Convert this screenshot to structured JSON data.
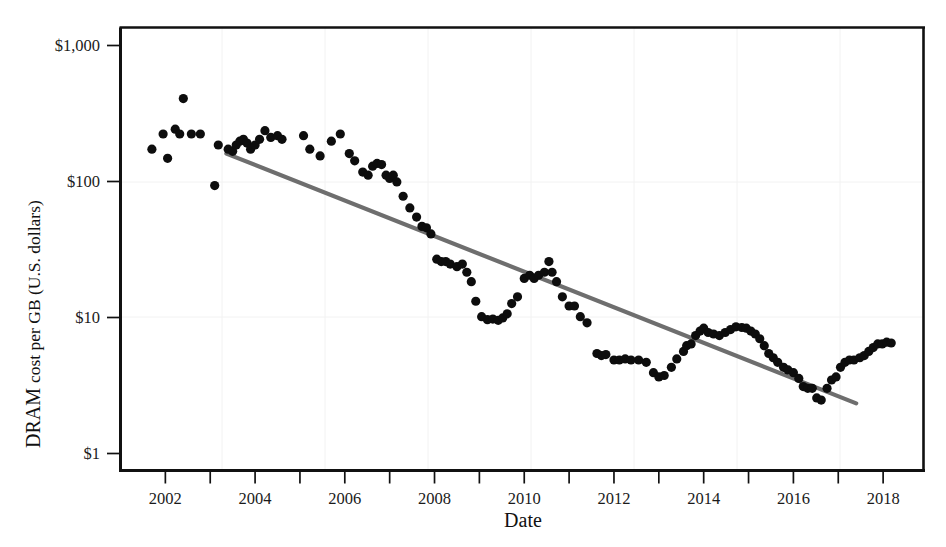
{
  "chart_data": {
    "type": "scatter",
    "title": "",
    "xlabel": "Date",
    "ylabel": "DRAM cost per GB (U.S. dollars)",
    "ylabel_parts": {
      "lead": "DRAM",
      "rest": "cost per GB (U.S. dollars)"
    },
    "yscale": "log",
    "ylim": [
      1,
      1000
    ],
    "xlim": [
      2001.0,
      2018.9
    ],
    "grid": false,
    "legend": null,
    "x_tick_labels": [
      "2002",
      "2004",
      "2006",
      "2008",
      "2010",
      "2012",
      "2014",
      "2016",
      "2018"
    ],
    "x_tick_values": [
      2002,
      2004,
      2006,
      2008,
      2010,
      2012,
      2014,
      2016,
      2018
    ],
    "x_minor_tick_values": [
      2003,
      2005,
      2007,
      2009,
      2011,
      2013,
      2015,
      2017
    ],
    "y_tick_labels": [
      "$1,000",
      "$100",
      "$10",
      "$1"
    ],
    "y_tick_values": [
      1000,
      100,
      10,
      1
    ],
    "colors": {
      "points": "#0d0d0d",
      "trendline": "#6e6e6e",
      "axis": "#111111",
      "background": "#ffffff"
    },
    "point_radius_px": 4.6,
    "series": [
      {
        "name": "DRAM cost per GB",
        "marker": "filled-circle",
        "points": [
          [
            2001.7,
            150
          ],
          [
            2001.95,
            190
          ],
          [
            2002.05,
            130
          ],
          [
            2002.22,
            205
          ],
          [
            2002.32,
            190
          ],
          [
            2002.4,
            330
          ],
          [
            2002.58,
            190
          ],
          [
            2002.78,
            190
          ],
          [
            2003.1,
            85
          ],
          [
            2003.18,
            160
          ],
          [
            2003.4,
            150
          ],
          [
            2003.5,
            145
          ],
          [
            2003.58,
            160
          ],
          [
            2003.66,
            170
          ],
          [
            2003.74,
            175
          ],
          [
            2003.82,
            165
          ],
          [
            2003.9,
            150
          ],
          [
            2004.0,
            160
          ],
          [
            2004.1,
            175
          ],
          [
            2004.22,
            200
          ],
          [
            2004.35,
            180
          ],
          [
            2004.5,
            185
          ],
          [
            2004.6,
            175
          ],
          [
            2005.08,
            185
          ],
          [
            2005.22,
            150
          ],
          [
            2005.45,
            135
          ],
          [
            2005.7,
            170
          ],
          [
            2005.9,
            190
          ],
          [
            2006.1,
            140
          ],
          [
            2006.22,
            125
          ],
          [
            2006.4,
            105
          ],
          [
            2006.52,
            100
          ],
          [
            2006.62,
            115
          ],
          [
            2006.72,
            120
          ],
          [
            2006.82,
            118
          ],
          [
            2006.92,
            100
          ],
          [
            2007.0,
            95
          ],
          [
            2007.08,
            100
          ],
          [
            2007.16,
            90
          ],
          [
            2007.3,
            72
          ],
          [
            2007.45,
            60
          ],
          [
            2007.6,
            52
          ],
          [
            2007.72,
            45
          ],
          [
            2007.82,
            44
          ],
          [
            2007.92,
            40
          ],
          [
            2008.05,
            27
          ],
          [
            2008.15,
            26
          ],
          [
            2008.25,
            26
          ],
          [
            2008.35,
            25
          ],
          [
            2008.5,
            24
          ],
          [
            2008.62,
            25
          ],
          [
            2008.72,
            22
          ],
          [
            2008.82,
            19
          ],
          [
            2008.92,
            14
          ],
          [
            2009.05,
            11
          ],
          [
            2009.18,
            10.5
          ],
          [
            2009.3,
            10.6
          ],
          [
            2009.42,
            10.4
          ],
          [
            2009.52,
            10.8
          ],
          [
            2009.62,
            11.5
          ],
          [
            2009.72,
            13.5
          ],
          [
            2009.85,
            15
          ],
          [
            2010.0,
            20
          ],
          [
            2010.12,
            21
          ],
          [
            2010.22,
            20
          ],
          [
            2010.32,
            21
          ],
          [
            2010.45,
            22
          ],
          [
            2010.55,
            26
          ],
          [
            2010.62,
            22
          ],
          [
            2010.72,
            19
          ],
          [
            2010.85,
            15
          ],
          [
            2011.0,
            13
          ],
          [
            2011.12,
            13
          ],
          [
            2011.25,
            11
          ],
          [
            2011.4,
            10
          ],
          [
            2011.62,
            6.2
          ],
          [
            2011.72,
            6.0
          ],
          [
            2011.82,
            6.1
          ],
          [
            2012.0,
            5.6
          ],
          [
            2012.12,
            5.6
          ],
          [
            2012.25,
            5.7
          ],
          [
            2012.38,
            5.6
          ],
          [
            2012.55,
            5.6
          ],
          [
            2012.72,
            5.4
          ],
          [
            2012.88,
            4.6
          ],
          [
            2013.0,
            4.3
          ],
          [
            2013.12,
            4.4
          ],
          [
            2013.28,
            5.0
          ],
          [
            2013.4,
            5.7
          ],
          [
            2013.55,
            6.4
          ],
          [
            2013.62,
            7.0
          ],
          [
            2013.72,
            7.2
          ],
          [
            2013.82,
            8.2
          ],
          [
            2013.92,
            8.8
          ],
          [
            2014.0,
            9.2
          ],
          [
            2014.1,
            8.6
          ],
          [
            2014.22,
            8.4
          ],
          [
            2014.35,
            8.2
          ],
          [
            2014.48,
            8.6
          ],
          [
            2014.6,
            9.0
          ],
          [
            2014.72,
            9.4
          ],
          [
            2014.85,
            9.3
          ],
          [
            2014.95,
            9.2
          ],
          [
            2015.05,
            8.8
          ],
          [
            2015.15,
            8.4
          ],
          [
            2015.25,
            7.8
          ],
          [
            2015.35,
            7.0
          ],
          [
            2015.45,
            6.2
          ],
          [
            2015.55,
            5.8
          ],
          [
            2015.65,
            5.4
          ],
          [
            2015.78,
            5.0
          ],
          [
            2015.88,
            4.8
          ],
          [
            2016.0,
            4.6
          ],
          [
            2016.12,
            4.2
          ],
          [
            2016.22,
            3.7
          ],
          [
            2016.32,
            3.6
          ],
          [
            2016.42,
            3.6
          ],
          [
            2016.52,
            3.1
          ],
          [
            2016.62,
            3.0
          ],
          [
            2016.75,
            3.6
          ],
          [
            2016.85,
            4.1
          ],
          [
            2016.95,
            4.3
          ],
          [
            2017.05,
            5.0
          ],
          [
            2017.15,
            5.4
          ],
          [
            2017.25,
            5.6
          ],
          [
            2017.35,
            5.6
          ],
          [
            2017.48,
            5.8
          ],
          [
            2017.58,
            6.0
          ],
          [
            2017.68,
            6.4
          ],
          [
            2017.78,
            6.8
          ],
          [
            2017.88,
            7.2
          ],
          [
            2017.98,
            7.2
          ],
          [
            2018.08,
            7.4
          ],
          [
            2018.18,
            7.3
          ]
        ]
      }
    ],
    "trendline": {
      "name": "log-linear fit",
      "start": [
        2003.36,
        140
      ],
      "end": [
        2017.4,
        2.85
      ]
    }
  }
}
